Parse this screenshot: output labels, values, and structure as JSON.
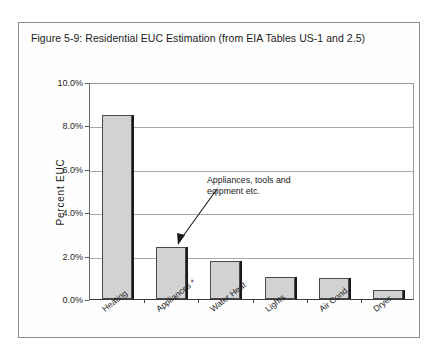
{
  "figure": {
    "title": "Figure 5-9:  Residential EUC Estimation (from EIA Tables US-1 and 2.5)"
  },
  "annotation": {
    "line1": "Appliances, tools and",
    "line2": "eqipment etc.",
    "arrow_name": "annotation-arrow"
  },
  "chart_data": {
    "type": "bar",
    "title": "Figure 5-9:  Residential EUC Estimation (from EIA Tables US-1 and 2.5)",
    "xlabel": "",
    "ylabel": "Percent EUC",
    "ylim": [
      0,
      10
    ],
    "ytick_labels": [
      "10.0%",
      "8.0%",
      "6.0%",
      "4.0%",
      "2.0%",
      "0.0%"
    ],
    "ytick_values": [
      10,
      8,
      6,
      4,
      2,
      0
    ],
    "grid": "horizontal",
    "legend": "none",
    "categories": [
      "Heating",
      "Appliances *",
      "Water Heat",
      "Lights",
      "Air Cond.",
      "Dryer"
    ],
    "values": [
      8.5,
      2.4,
      1.75,
      1.0,
      0.95,
      0.4
    ],
    "value_labels": [
      "8.5%",
      "2.4%",
      "1.75%",
      "1.0%",
      "0.95%",
      "0.4%"
    ],
    "bar_color": "#d2d2d2",
    "bar_edge_color": "#4a4a4a",
    "annotations": [
      {
        "text": "Appliances, tools and eqipment etc.",
        "points_to": "Appliances *"
      }
    ]
  }
}
